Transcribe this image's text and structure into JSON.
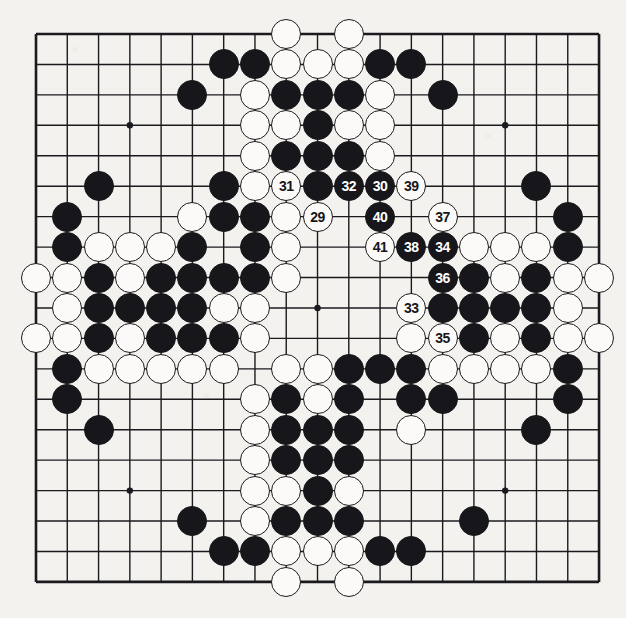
{
  "diagram": {
    "kind": "go-board-diagram",
    "board_size": 19,
    "colors": {
      "paper": "#f4f2ee",
      "line": "#1b1a1e",
      "black_stone": "#17161a",
      "white_stone": "#fbfaf8",
      "stone_outline": "#1b1a1e",
      "black_label_text": "#ffffff",
      "white_label_text": "#17161a"
    },
    "geometry": {
      "origin_x": 36,
      "origin_y": 34,
      "step_x": 31.28,
      "step_y": 30.44,
      "stone_diameter": 30,
      "line_width": 1.4,
      "edge_line_width": 2.6
    },
    "star_points": [
      {
        "col": 3,
        "row": 3
      },
      {
        "col": 9,
        "row": 3
      },
      {
        "col": 15,
        "row": 3
      },
      {
        "col": 3,
        "row": 9
      },
      {
        "col": 9,
        "row": 9
      },
      {
        "col": 15,
        "row": 9
      },
      {
        "col": 3,
        "row": 15
      },
      {
        "col": 9,
        "row": 15
      },
      {
        "col": 15,
        "row": 15
      }
    ],
    "move_numbers": [
      "29",
      "30",
      "31",
      "32",
      "33",
      "34",
      "35",
      "36",
      "37",
      "38",
      "39",
      "40",
      "41"
    ],
    "stones": [
      {
        "col": 8,
        "row": 0,
        "color": "white"
      },
      {
        "col": 10,
        "row": 0,
        "color": "white"
      },
      {
        "col": 6,
        "row": 1,
        "color": "black"
      },
      {
        "col": 7,
        "row": 1,
        "color": "black"
      },
      {
        "col": 8,
        "row": 1,
        "color": "white"
      },
      {
        "col": 9,
        "row": 1,
        "color": "white"
      },
      {
        "col": 10,
        "row": 1,
        "color": "white"
      },
      {
        "col": 11,
        "row": 1,
        "color": "black"
      },
      {
        "col": 12,
        "row": 1,
        "color": "black"
      },
      {
        "col": 5,
        "row": 2,
        "color": "black"
      },
      {
        "col": 7,
        "row": 2,
        "color": "white"
      },
      {
        "col": 8,
        "row": 2,
        "color": "black"
      },
      {
        "col": 9,
        "row": 2,
        "color": "black"
      },
      {
        "col": 10,
        "row": 2,
        "color": "black"
      },
      {
        "col": 11,
        "row": 2,
        "color": "white"
      },
      {
        "col": 13,
        "row": 2,
        "color": "black"
      },
      {
        "col": 7,
        "row": 3,
        "color": "white"
      },
      {
        "col": 8,
        "row": 3,
        "color": "white"
      },
      {
        "col": 9,
        "row": 3,
        "color": "black"
      },
      {
        "col": 10,
        "row": 3,
        "color": "white"
      },
      {
        "col": 11,
        "row": 3,
        "color": "white"
      },
      {
        "col": 7,
        "row": 4,
        "color": "white"
      },
      {
        "col": 8,
        "row": 4,
        "color": "black"
      },
      {
        "col": 9,
        "row": 4,
        "color": "black"
      },
      {
        "col": 10,
        "row": 4,
        "color": "black"
      },
      {
        "col": 11,
        "row": 4,
        "color": "white"
      },
      {
        "col": 2,
        "row": 5,
        "color": "black"
      },
      {
        "col": 6,
        "row": 5,
        "color": "black"
      },
      {
        "col": 7,
        "row": 5,
        "color": "white"
      },
      {
        "col": 8,
        "row": 5,
        "color": "white",
        "label": "31"
      },
      {
        "col": 9,
        "row": 5,
        "color": "black"
      },
      {
        "col": 10,
        "row": 5,
        "color": "black",
        "label": "32"
      },
      {
        "col": 11,
        "row": 5,
        "color": "black",
        "label": "30"
      },
      {
        "col": 12,
        "row": 5,
        "color": "white",
        "label": "39"
      },
      {
        "col": 16,
        "row": 5,
        "color": "black"
      },
      {
        "col": 1,
        "row": 6,
        "color": "black"
      },
      {
        "col": 5,
        "row": 6,
        "color": "white"
      },
      {
        "col": 6,
        "row": 6,
        "color": "black"
      },
      {
        "col": 7,
        "row": 6,
        "color": "black"
      },
      {
        "col": 8,
        "row": 6,
        "color": "white"
      },
      {
        "col": 9,
        "row": 6,
        "color": "white",
        "label": "29"
      },
      {
        "col": 11,
        "row": 6,
        "color": "black",
        "label": "40"
      },
      {
        "col": 13,
        "row": 6,
        "color": "white",
        "label": "37"
      },
      {
        "col": 17,
        "row": 6,
        "color": "black"
      },
      {
        "col": 1,
        "row": 7,
        "color": "black"
      },
      {
        "col": 2,
        "row": 7,
        "color": "white"
      },
      {
        "col": 3,
        "row": 7,
        "color": "white"
      },
      {
        "col": 4,
        "row": 7,
        "color": "white"
      },
      {
        "col": 5,
        "row": 7,
        "color": "black"
      },
      {
        "col": 7,
        "row": 7,
        "color": "black"
      },
      {
        "col": 8,
        "row": 7,
        "color": "white"
      },
      {
        "col": 11,
        "row": 7,
        "color": "white",
        "label": "41"
      },
      {
        "col": 12,
        "row": 7,
        "color": "black",
        "label": "38"
      },
      {
        "col": 13,
        "row": 7,
        "color": "black",
        "label": "34"
      },
      {
        "col": 14,
        "row": 7,
        "color": "white"
      },
      {
        "col": 15,
        "row": 7,
        "color": "white"
      },
      {
        "col": 16,
        "row": 7,
        "color": "white"
      },
      {
        "col": 17,
        "row": 7,
        "color": "black"
      },
      {
        "col": 0,
        "row": 8,
        "color": "white"
      },
      {
        "col": 1,
        "row": 8,
        "color": "white"
      },
      {
        "col": 2,
        "row": 8,
        "color": "black"
      },
      {
        "col": 3,
        "row": 8,
        "color": "white"
      },
      {
        "col": 4,
        "row": 8,
        "color": "black"
      },
      {
        "col": 5,
        "row": 8,
        "color": "black"
      },
      {
        "col": 6,
        "row": 8,
        "color": "black"
      },
      {
        "col": 7,
        "row": 8,
        "color": "black"
      },
      {
        "col": 8,
        "row": 8,
        "color": "white"
      },
      {
        "col": 13,
        "row": 8,
        "color": "black",
        "label": "36"
      },
      {
        "col": 14,
        "row": 8,
        "color": "black"
      },
      {
        "col": 15,
        "row": 8,
        "color": "white"
      },
      {
        "col": 16,
        "row": 8,
        "color": "black"
      },
      {
        "col": 17,
        "row": 8,
        "color": "white"
      },
      {
        "col": 18,
        "row": 8,
        "color": "white"
      },
      {
        "col": 1,
        "row": 9,
        "color": "white"
      },
      {
        "col": 2,
        "row": 9,
        "color": "black"
      },
      {
        "col": 3,
        "row": 9,
        "color": "black"
      },
      {
        "col": 4,
        "row": 9,
        "color": "black"
      },
      {
        "col": 5,
        "row": 9,
        "color": "black"
      },
      {
        "col": 6,
        "row": 9,
        "color": "white"
      },
      {
        "col": 7,
        "row": 9,
        "color": "white"
      },
      {
        "col": 12,
        "row": 9,
        "color": "white",
        "label": "33"
      },
      {
        "col": 13,
        "row": 9,
        "color": "black"
      },
      {
        "col": 14,
        "row": 9,
        "color": "black"
      },
      {
        "col": 15,
        "row": 9,
        "color": "black"
      },
      {
        "col": 16,
        "row": 9,
        "color": "black"
      },
      {
        "col": 17,
        "row": 9,
        "color": "white"
      },
      {
        "col": 0,
        "row": 10,
        "color": "white"
      },
      {
        "col": 1,
        "row": 10,
        "color": "white"
      },
      {
        "col": 2,
        "row": 10,
        "color": "black"
      },
      {
        "col": 3,
        "row": 10,
        "color": "white"
      },
      {
        "col": 4,
        "row": 10,
        "color": "black"
      },
      {
        "col": 5,
        "row": 10,
        "color": "black"
      },
      {
        "col": 6,
        "row": 10,
        "color": "black"
      },
      {
        "col": 7,
        "row": 10,
        "color": "white"
      },
      {
        "col": 12,
        "row": 10,
        "color": "white"
      },
      {
        "col": 13,
        "row": 10,
        "color": "white",
        "label": "35"
      },
      {
        "col": 14,
        "row": 10,
        "color": "black"
      },
      {
        "col": 15,
        "row": 10,
        "color": "white"
      },
      {
        "col": 16,
        "row": 10,
        "color": "black"
      },
      {
        "col": 17,
        "row": 10,
        "color": "white"
      },
      {
        "col": 18,
        "row": 10,
        "color": "white"
      },
      {
        "col": 1,
        "row": 11,
        "color": "black"
      },
      {
        "col": 2,
        "row": 11,
        "color": "white"
      },
      {
        "col": 3,
        "row": 11,
        "color": "white"
      },
      {
        "col": 4,
        "row": 11,
        "color": "white"
      },
      {
        "col": 5,
        "row": 11,
        "color": "white"
      },
      {
        "col": 6,
        "row": 11,
        "color": "white"
      },
      {
        "col": 8,
        "row": 11,
        "color": "white"
      },
      {
        "col": 9,
        "row": 11,
        "color": "white"
      },
      {
        "col": 10,
        "row": 11,
        "color": "black"
      },
      {
        "col": 11,
        "row": 11,
        "color": "black"
      },
      {
        "col": 12,
        "row": 11,
        "color": "black"
      },
      {
        "col": 13,
        "row": 11,
        "color": "white"
      },
      {
        "col": 14,
        "row": 11,
        "color": "white"
      },
      {
        "col": 15,
        "row": 11,
        "color": "white"
      },
      {
        "col": 16,
        "row": 11,
        "color": "white"
      },
      {
        "col": 17,
        "row": 11,
        "color": "black"
      },
      {
        "col": 1,
        "row": 12,
        "color": "black"
      },
      {
        "col": 7,
        "row": 12,
        "color": "white"
      },
      {
        "col": 8,
        "row": 12,
        "color": "black"
      },
      {
        "col": 9,
        "row": 12,
        "color": "white"
      },
      {
        "col": 10,
        "row": 12,
        "color": "black"
      },
      {
        "col": 12,
        "row": 12,
        "color": "black"
      },
      {
        "col": 13,
        "row": 12,
        "color": "black"
      },
      {
        "col": 17,
        "row": 12,
        "color": "black"
      },
      {
        "col": 2,
        "row": 13,
        "color": "black"
      },
      {
        "col": 7,
        "row": 13,
        "color": "white"
      },
      {
        "col": 8,
        "row": 13,
        "color": "black"
      },
      {
        "col": 9,
        "row": 13,
        "color": "black"
      },
      {
        "col": 10,
        "row": 13,
        "color": "black"
      },
      {
        "col": 12,
        "row": 13,
        "color": "white"
      },
      {
        "col": 16,
        "row": 13,
        "color": "black"
      },
      {
        "col": 7,
        "row": 14,
        "color": "white"
      },
      {
        "col": 8,
        "row": 14,
        "color": "black"
      },
      {
        "col": 9,
        "row": 14,
        "color": "black"
      },
      {
        "col": 10,
        "row": 14,
        "color": "black"
      },
      {
        "col": 7,
        "row": 15,
        "color": "white"
      },
      {
        "col": 8,
        "row": 15,
        "color": "white"
      },
      {
        "col": 9,
        "row": 15,
        "color": "black"
      },
      {
        "col": 10,
        "row": 15,
        "color": "white"
      },
      {
        "col": 5,
        "row": 16,
        "color": "black"
      },
      {
        "col": 7,
        "row": 16,
        "color": "white"
      },
      {
        "col": 8,
        "row": 16,
        "color": "black"
      },
      {
        "col": 9,
        "row": 16,
        "color": "black"
      },
      {
        "col": 10,
        "row": 16,
        "color": "black"
      },
      {
        "col": 14,
        "row": 16,
        "color": "black"
      },
      {
        "col": 6,
        "row": 17,
        "color": "black"
      },
      {
        "col": 7,
        "row": 17,
        "color": "black"
      },
      {
        "col": 8,
        "row": 17,
        "color": "white"
      },
      {
        "col": 9,
        "row": 17,
        "color": "white"
      },
      {
        "col": 10,
        "row": 17,
        "color": "white"
      },
      {
        "col": 11,
        "row": 17,
        "color": "black"
      },
      {
        "col": 12,
        "row": 17,
        "color": "black"
      },
      {
        "col": 8,
        "row": 18,
        "color": "white"
      },
      {
        "col": 10,
        "row": 18,
        "color": "white"
      }
    ]
  }
}
